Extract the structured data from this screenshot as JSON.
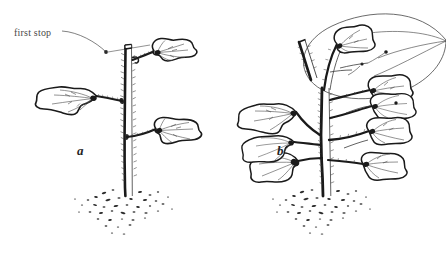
{
  "figure": {
    "background_color": "#ffffff",
    "ink_color": "#1a1a1a",
    "label_color": "#4a4a4a",
    "width": 446,
    "height": 254
  },
  "annotations": {
    "first_stop": {
      "text": "first stop",
      "x": 14,
      "y": 28,
      "leader_dot": {
        "x": 106,
        "y": 52
      }
    }
  },
  "panels": [
    {
      "id": "a",
      "label": "a",
      "label_x": 77,
      "label_y": 144,
      "description": "single stem plant with first stop pruning cut",
      "stem_top_cut": true,
      "leaf_count": 3
    },
    {
      "id": "b",
      "label": "b",
      "label_x": 277,
      "label_y": 144,
      "description": "branched plant after first stop with new side shoots",
      "stem_top_cut": false,
      "leaf_count": 8,
      "highlight_ellipse": true
    }
  ]
}
